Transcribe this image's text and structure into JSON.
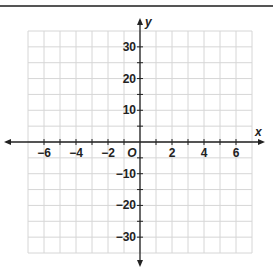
{
  "chart_data": {
    "type": "line",
    "title": "",
    "xlabel": "x",
    "ylabel": "y",
    "origin_label": "O",
    "xlim": [
      -7,
      7
    ],
    "ylim": [
      -35,
      35
    ],
    "grid": true,
    "x_tick_labels": [
      "−6",
      "−4",
      "−2",
      "2",
      "4",
      "6"
    ],
    "x_ticks": [
      -6,
      -4,
      -2,
      2,
      4,
      6
    ],
    "y_tick_labels": [
      "30",
      "20",
      "10",
      "−10",
      "−20",
      "−30"
    ],
    "y_ticks": [
      30,
      20,
      10,
      -10,
      -20,
      -30
    ],
    "x_grid_step": 1,
    "y_grid_step": 5,
    "series": []
  },
  "colors": {
    "grid": "#d6d6d6",
    "axis": "#222222",
    "border": "#555555"
  }
}
